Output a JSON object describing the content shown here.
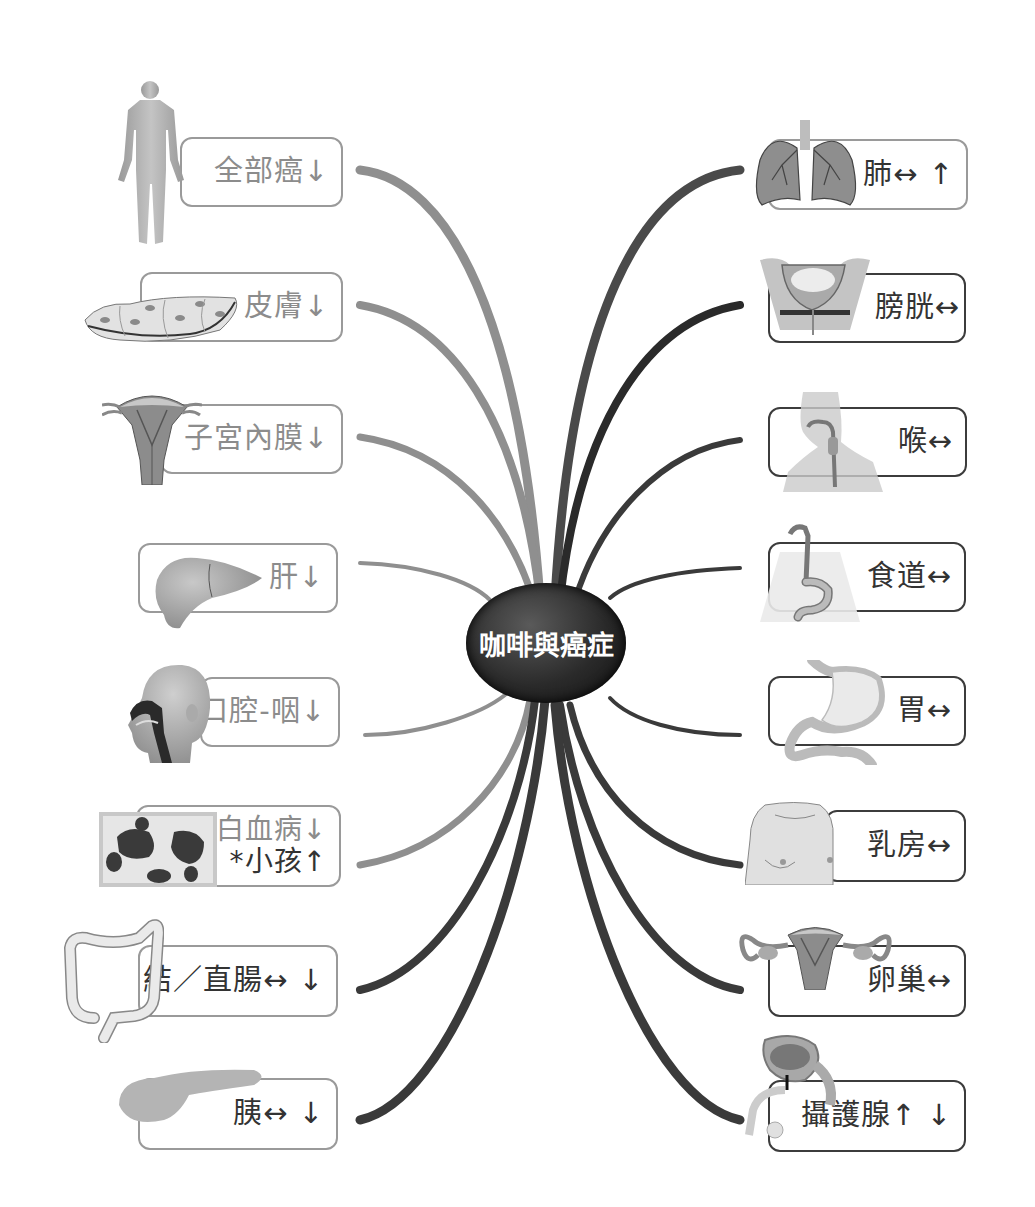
{
  "title": "咖啡與癌症",
  "legend_symbols": {
    "decrease": "↓",
    "increase": "↑",
    "no_change": "↔"
  },
  "left_nodes": [
    {
      "id": "all-cancer",
      "label": "全部癌",
      "marks": "↓",
      "illustration": "human-body"
    },
    {
      "id": "skin",
      "label": "皮膚",
      "marks": "↓",
      "illustration": "skin-cells"
    },
    {
      "id": "endometrium",
      "label": "子宮內膜",
      "marks": "↓",
      "illustration": "uterus"
    },
    {
      "id": "liver",
      "label": "肝",
      "marks": "↓",
      "illustration": "liver"
    },
    {
      "id": "oral-pharynx",
      "label": "口腔-咽",
      "marks": "↓",
      "illustration": "head-cross-section"
    },
    {
      "id": "leukemia",
      "label": "白血病",
      "marks": "↓",
      "line2": "*小孩",
      "line2_marks": "↑",
      "illustration": "blood-cells"
    },
    {
      "id": "colorectal",
      "label": "結／直腸",
      "marks": "↔ ↓",
      "illustration": "colon"
    },
    {
      "id": "pancreas",
      "label": "胰",
      "marks": "↔ ↓",
      "illustration": "pancreas"
    }
  ],
  "right_nodes": [
    {
      "id": "lung",
      "label": "肺",
      "marks": "↔ ↑",
      "illustration": "lungs"
    },
    {
      "id": "bladder",
      "label": "膀胱",
      "marks": "↔",
      "illustration": "bladder"
    },
    {
      "id": "larynx",
      "label": "喉",
      "marks": "↔",
      "illustration": "throat"
    },
    {
      "id": "esophagus",
      "label": "食道",
      "marks": "↔",
      "illustration": "esophagus"
    },
    {
      "id": "stomach",
      "label": "胃",
      "marks": "↔",
      "illustration": "stomach"
    },
    {
      "id": "breast",
      "label": "乳房",
      "marks": "↔",
      "illustration": "chest"
    },
    {
      "id": "ovary",
      "label": "卵巢",
      "marks": "↔",
      "illustration": "ovaries"
    },
    {
      "id": "prostate",
      "label": "攝護腺",
      "marks": "↑ ↓",
      "illustration": "prostate"
    }
  ],
  "colors": {
    "decrease_branch": "#8f8f8f",
    "neutral_branch": "#3a3a3a",
    "light_text": "#8c8c8c",
    "dark_text": "#333333",
    "center_fill": "#222222"
  }
}
